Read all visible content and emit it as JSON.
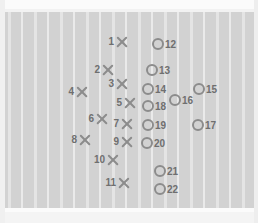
{
  "diagram": {
    "field": {
      "surface_color": "#d2d2d2",
      "yard_line_color": "#eaeaea",
      "sideline_color": "#fbfbfb",
      "marker_color": "#8c8c8c",
      "label_color": "#6f6f6f",
      "yard_line_count": 19,
      "yard_line_spacing_px": 13
    },
    "legend": {
      "x_marker_name": "x-marker",
      "o_marker_name": "o-marker",
      "x_marker_count": 11,
      "o_marker_count": 11
    },
    "markers": [
      {
        "id": "1",
        "type": "x",
        "label": "1",
        "x": 122,
        "y": 42
      },
      {
        "id": "2",
        "type": "x",
        "label": "2",
        "x": 108,
        "y": 70
      },
      {
        "id": "3",
        "type": "x",
        "label": "3",
        "x": 122,
        "y": 84
      },
      {
        "id": "4",
        "type": "x",
        "label": "4",
        "x": 82,
        "y": 92
      },
      {
        "id": "5",
        "type": "x",
        "label": "5",
        "x": 130,
        "y": 103
      },
      {
        "id": "6",
        "type": "x",
        "label": "6",
        "x": 102,
        "y": 119
      },
      {
        "id": "7",
        "type": "x",
        "label": "7",
        "x": 127,
        "y": 124
      },
      {
        "id": "8",
        "type": "x",
        "label": "8",
        "x": 85,
        "y": 140
      },
      {
        "id": "9",
        "type": "x",
        "label": "9",
        "x": 127,
        "y": 142
      },
      {
        "id": "10",
        "type": "x",
        "label": "10",
        "x": 113,
        "y": 160
      },
      {
        "id": "11",
        "type": "x",
        "label": "11",
        "x": 124,
        "y": 183
      },
      {
        "id": "12",
        "type": "o",
        "label": "12",
        "x": 158,
        "y": 44
      },
      {
        "id": "13",
        "type": "o",
        "label": "13",
        "x": 152,
        "y": 70
      },
      {
        "id": "14",
        "type": "o",
        "label": "14",
        "x": 148,
        "y": 89
      },
      {
        "id": "15",
        "type": "o",
        "label": "15",
        "x": 199,
        "y": 89
      },
      {
        "id": "16",
        "type": "o",
        "label": "16",
        "x": 175,
        "y": 100
      },
      {
        "id": "17",
        "type": "o",
        "label": "17",
        "x": 198,
        "y": 125
      },
      {
        "id": "18",
        "type": "o",
        "label": "18",
        "x": 148,
        "y": 106
      },
      {
        "id": "19",
        "type": "o",
        "label": "19",
        "x": 148,
        "y": 125
      },
      {
        "id": "20",
        "type": "o",
        "label": "20",
        "x": 147,
        "y": 143
      },
      {
        "id": "21",
        "type": "o",
        "label": "21",
        "x": 160,
        "y": 171
      },
      {
        "id": "22",
        "type": "o",
        "label": "22",
        "x": 160,
        "y": 189
      }
    ],
    "yard_lines": [
      8,
      21,
      34,
      47,
      60,
      73,
      86,
      99,
      112,
      125,
      138,
      151,
      164,
      177,
      190,
      203,
      216,
      229,
      242
    ]
  }
}
